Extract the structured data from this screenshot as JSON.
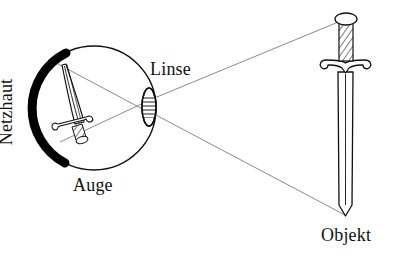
{
  "figure": {
    "background_color": "#ffffff",
    "ink_color": "#111111",
    "ray_color": "#8a8a8a",
    "retina_color": "#000000",
    "labels": {
      "netzhaut": "Netzhaut",
      "auge": "Auge",
      "linse": "Linse",
      "objekt": "Objekt"
    },
    "parts": [
      {
        "name": "eye",
        "label": "Auge",
        "shape": "circle",
        "center_x": 94,
        "center_y": 108,
        "radius": 62
      },
      {
        "name": "retina",
        "label": "Netzhaut",
        "shape": "thick-arc",
        "side": "left",
        "color": "#000000"
      },
      {
        "name": "lens",
        "label": "Linse",
        "shape": "ellipse",
        "center_x": 149,
        "center_y": 107,
        "rx": 7,
        "ry": 19,
        "hatching": "horizontal"
      },
      {
        "name": "object-sword",
        "label": "Objekt",
        "orientation": "upright",
        "tip_x": 345,
        "tip_y": 216,
        "pommel_x": 348,
        "pommel_y": 16
      },
      {
        "name": "retinal-image-sword",
        "orientation": "inverted",
        "note": "verkleinertes, umgekehrtes Bild auf der Netzhaut"
      }
    ],
    "rays": [
      {
        "name": "ray-top",
        "from": "object-pommel",
        "to": "lens",
        "x1": 348,
        "y1": 18,
        "x2": 152,
        "y2": 99
      },
      {
        "name": "ray-bottom",
        "from": "lens",
        "to": "object-tip",
        "x1": 152,
        "y1": 113,
        "x2": 345,
        "y2": 215
      },
      {
        "name": "ray-inside-upper",
        "from": "lens",
        "to": "retina-image-bottom",
        "x1": 147,
        "y1": 100,
        "x2": 66,
        "y2": 141
      },
      {
        "name": "ray-inside-lower",
        "from": "lens",
        "to": "retina-image-top",
        "x1": 147,
        "y1": 113,
        "x2": 63,
        "y2": 66
      }
    ]
  }
}
